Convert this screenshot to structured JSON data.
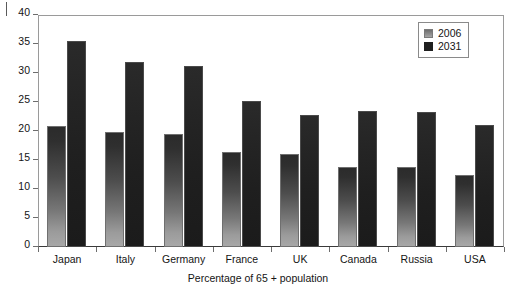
{
  "chart_data": {
    "type": "bar",
    "title": "",
    "xlabel": "Percentage of 65 + population",
    "ylabel": "",
    "ylim": [
      0,
      40
    ],
    "yticks": [
      0,
      5,
      10,
      15,
      20,
      25,
      30,
      35,
      40
    ],
    "grid": false,
    "legend_position": "top-right",
    "categories": [
      "Japan",
      "Italy",
      "Germany",
      "France",
      "UK",
      "Canada",
      "Russia",
      "USA"
    ],
    "series": [
      {
        "name": "2006",
        "color": "#a0a0a0",
        "values": [
          20.8,
          19.8,
          19.4,
          16.3,
          16.1,
          13.8,
          13.8,
          12.4
        ]
      },
      {
        "name": "2031",
        "color": "#1f1f1f",
        "values": [
          35.5,
          31.9,
          31.2,
          25.2,
          22.7,
          23.5,
          23.3,
          21.0
        ]
      }
    ]
  },
  "legend": {
    "entries": [
      {
        "label": "2006",
        "swatch": "light-gray-square-icon"
      },
      {
        "label": "2031",
        "swatch": "dark-square-icon"
      }
    ]
  }
}
